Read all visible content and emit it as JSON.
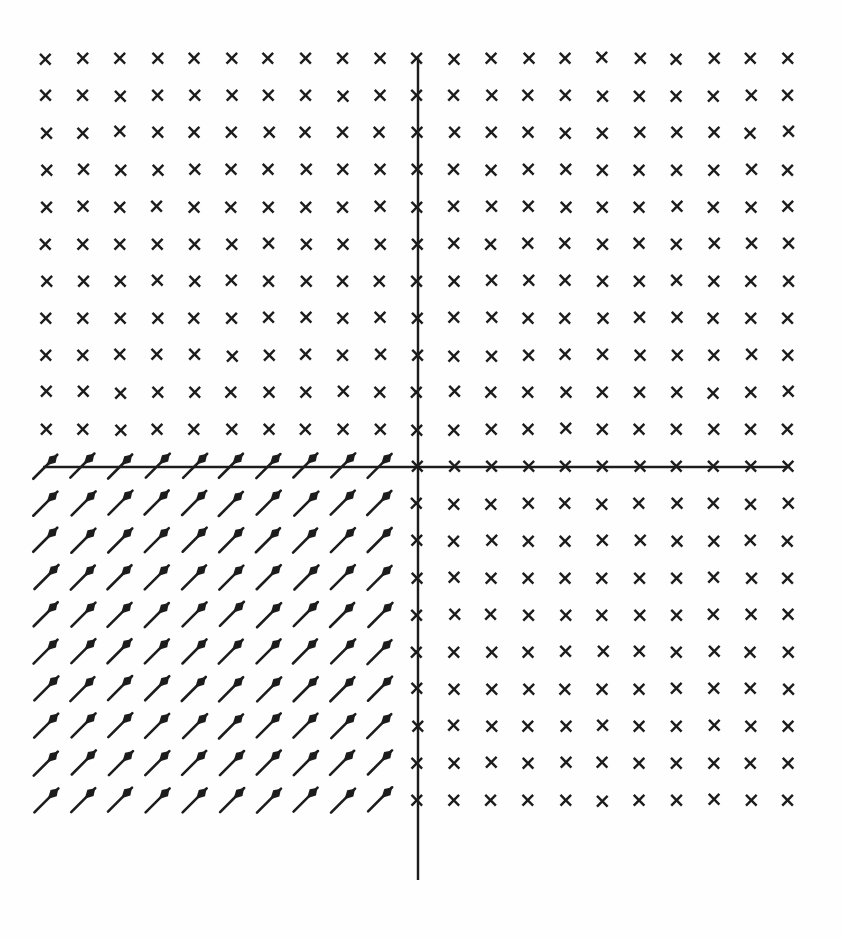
{
  "figure": {
    "background_color": "#fefefe",
    "ink_color": "#1a1a1a",
    "width": 843,
    "height": 939
  },
  "axes": {
    "x_axis_label": "",
    "y_axis_label": "",
    "origin_px": [
      418,
      467
    ],
    "x_axis_span_px": [
      43,
      790
    ],
    "y_axis_span_px": [
      58,
      880
    ],
    "line_color": "#1a1a1a",
    "line_width": 2.4
  },
  "grid": {
    "columns": 21,
    "rows": 21,
    "x_start_px": 46,
    "y_start_px": 58,
    "spacing_px": 37.1,
    "origin_col_index": 10,
    "origin_row_index": 10
  },
  "marker": {
    "zero_glyph": "×",
    "zero_glyph_name": "cross-marker",
    "arrow_glyph_name": "vector-arrow",
    "arrow_angle_deg": 45,
    "arrow_length_px": 34,
    "arrow_direction": "up-right"
  },
  "chart_data": {
    "type": "scatter",
    "xlabel": "",
    "ylabel": "",
    "xlim": [
      -10,
      10
    ],
    "ylim": [
      -10,
      10
    ],
    "grid": false,
    "legend": "none",
    "categories": [
      "zero-vector",
      "up-right-arrow"
    ],
    "values": [
      341,
      100
    ],
    "series": [
      {
        "name": "zero-vector",
        "marker": "×",
        "count": 341,
        "region": "x >= 0 or y >= 0"
      },
      {
        "name": "up-right-arrow",
        "marker": "arrow",
        "count": 100,
        "region": "x < 0 and y < 0",
        "angle_deg": 45
      }
    ],
    "x": [
      -10,
      -9,
      -8,
      -7,
      -6,
      -5,
      -4,
      -3,
      -2,
      -1,
      0,
      1,
      2,
      3,
      4,
      5,
      6,
      7,
      8,
      9,
      10
    ],
    "y": [
      10,
      9,
      8,
      7,
      6,
      5,
      4,
      3,
      2,
      1,
      0,
      -1,
      -2,
      -3,
      -4,
      -5,
      -6,
      -7,
      -8,
      -9,
      -10
    ]
  }
}
